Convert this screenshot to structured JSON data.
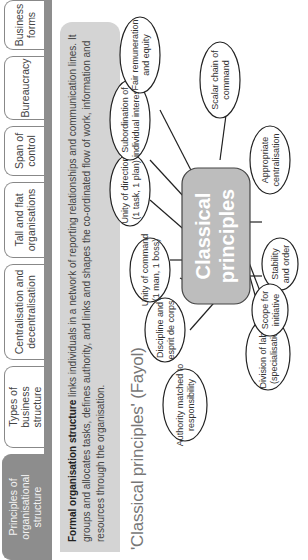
{
  "tabs": [
    {
      "label": "Principles of\norganisational structure",
      "active": true
    },
    {
      "label": "Types of\nbusiness structure",
      "active": false
    },
    {
      "label": "Centralisation and\ndecentralisation",
      "active": false
    },
    {
      "label": "Tall and flat\norganisations",
      "active": false
    },
    {
      "label": "Span of\ncontrol",
      "active": false
    },
    {
      "label": "Bureaucracy",
      "active": false
    },
    {
      "label": "Business\nforms",
      "active": false
    }
  ],
  "intro": {
    "term": "Formal organisation structure",
    "text": " links individuals in a network of reporting relationships and communication lines. It groups and allocates tasks, defines authority, and links and shapes the co-ordinated flow of work, information and resources through the organisation."
  },
  "section_title": "'Classical principles' (Fayol)",
  "diagram": {
    "center": "Classical\nprinciples",
    "nodes": [
      "Division of labour\n(specialisation)",
      "Authority matched to\nresponsibility",
      "Discipline and\nesprit de corps",
      "Unity of command\n(1 man, 1 boss)",
      "Unity of direction\n(1 task, 1 plan)",
      "Subordination of\nindividual interests",
      "Fair remuneration\nand equity",
      "Scalar chain of\ncommand",
      "Appropriate\ncentralisation",
      "Stability\nand order",
      "Scope for\ninitiative"
    ]
  }
}
